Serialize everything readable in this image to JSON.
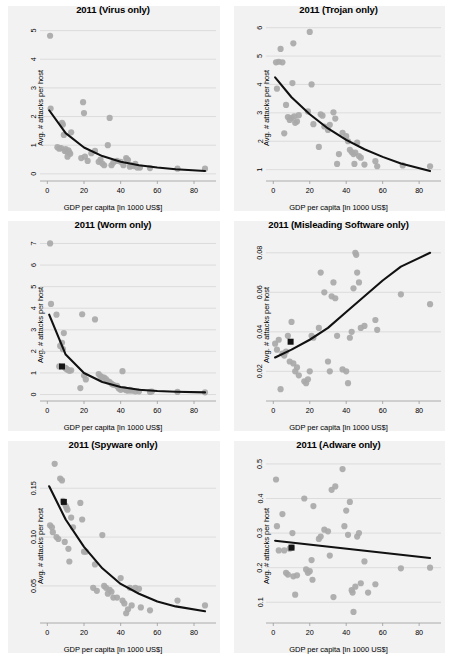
{
  "figure": {
    "name": "avg-attacks-vs-gdp-2011",
    "panel_count": 6,
    "point_color": "#a9a9a9",
    "line_color": "#111111",
    "panel_bg": "#f2f2f2",
    "grid_color": "#d2d2d2"
  },
  "common": {
    "xlabel": "GDP per capita [in 1000 US$]",
    "ylabel": "Avg. # attacks per host",
    "xticks": [
      0,
      20,
      40,
      60,
      80
    ],
    "xlim": [
      -4,
      92
    ],
    "grid": true,
    "legend": "none"
  },
  "chart_data": [
    {
      "type": "scatter",
      "title": "2011 (Virus only)",
      "xlabel": "GDP per capita [in 1000 US$]",
      "ylabel": "Avg. # attacks per host",
      "xlim": [
        -4,
        92
      ],
      "ylim": [
        -0.25,
        5.3
      ],
      "xticks": [
        0,
        20,
        40,
        60,
        80
      ],
      "yticks": [
        0,
        1,
        2,
        3,
        4,
        5
      ],
      "grid": true,
      "x": [
        1.5,
        1.8,
        5.5,
        6.5,
        7.5,
        8.0,
        8.5,
        9.0,
        9.5,
        10.0,
        10.5,
        11.0,
        11.5,
        12.0,
        12.5,
        13.0,
        18.5,
        19.5,
        20.0,
        20.5,
        22.0,
        24.0,
        26.0,
        28.0,
        29.0,
        30.0,
        31.0,
        33.0,
        34.0,
        35.0,
        36.0,
        38.0,
        40.0,
        41.5,
        43.0,
        43.5,
        44.0,
        45.0,
        46.0,
        47.0,
        48.0,
        49.0,
        50.5,
        56.0,
        71.0,
        86.0
      ],
      "y": [
        4.82,
        2.28,
        0.93,
        0.88,
        0.9,
        1.78,
        1.72,
        1.36,
        0.8,
        0.86,
        0.78,
        0.6,
        0.82,
        0.75,
        0.7,
        1.45,
        0.55,
        2.5,
        2.12,
        0.6,
        0.45,
        0.72,
        0.8,
        0.42,
        0.5,
        0.36,
        0.3,
        1.0,
        1.95,
        0.3,
        0.4,
        0.45,
        0.42,
        0.3,
        0.55,
        0.5,
        0.48,
        0.25,
        0.3,
        0.27,
        0.35,
        0.22,
        0.22,
        0.2,
        0.18,
        0.18
      ],
      "fit_type": "exponential-decay",
      "fit_x": [
        1.0,
        10,
        20,
        30,
        40,
        50,
        60,
        70,
        86
      ],
      "fit_y": [
        2.22,
        1.42,
        0.92,
        0.62,
        0.42,
        0.3,
        0.22,
        0.16,
        0.1
      ],
      "highlight_marker": null,
      "annotations": []
    },
    {
      "type": "scatter",
      "title": "2011 (Trojan only)",
      "xlabel": "GDP per capita [in 1000 US$]",
      "ylabel": "Avg. # attacks per host",
      "xlim": [
        -4,
        92
      ],
      "ylim": [
        0.6,
        6.2
      ],
      "xticks": [
        0,
        20,
        40,
        60,
        80
      ],
      "yticks": [
        1,
        2,
        3,
        4,
        5,
        6
      ],
      "grid": true,
      "x": [
        1.5,
        2.0,
        3.0,
        4.0,
        5.0,
        6.0,
        7.0,
        8.0,
        9.0,
        10.0,
        10.5,
        11.0,
        11.5,
        12.0,
        13.0,
        14.0,
        19.0,
        20.0,
        21.0,
        22.0,
        25.0,
        26.0,
        27.0,
        28.0,
        30.0,
        31.0,
        33.0,
        34.0,
        35.0,
        36.0,
        38.0,
        40.0,
        41.0,
        42.0,
        43.0,
        44.0,
        44.5,
        45.0,
        46.0,
        47.0,
        48.0,
        50.0,
        56.0,
        57.0,
        71.0,
        86.0
      ],
      "y": [
        4.78,
        3.85,
        4.8,
        5.25,
        4.78,
        2.28,
        3.28,
        2.85,
        2.75,
        2.82,
        4.05,
        5.45,
        2.88,
        2.65,
        2.7,
        2.92,
        3.05,
        5.85,
        4.0,
        2.6,
        1.8,
        2.95,
        2.9,
        2.52,
        2.4,
        2.58,
        3.02,
        2.8,
        1.2,
        1.55,
        2.3,
        2.18,
        2.0,
        1.7,
        1.62,
        1.55,
        1.2,
        1.6,
        1.95,
        1.48,
        1.42,
        1.18,
        1.3,
        1.12,
        1.15,
        1.12
      ],
      "fit_type": "exponential-decay",
      "fit_x": [
        1.0,
        10,
        20,
        30,
        40,
        50,
        60,
        70,
        86
      ],
      "fit_y": [
        4.25,
        3.55,
        2.95,
        2.45,
        2.05,
        1.72,
        1.45,
        1.22,
        0.95
      ],
      "highlight_marker": null,
      "annotations": []
    },
    {
      "type": "scatter",
      "title": "2011 (Worm only)",
      "xlabel": "GDP per capita [in 1000 US$]",
      "ylabel": "Avg. # attacks per host",
      "xlim": [
        -4,
        92
      ],
      "ylim": [
        -0.3,
        7.3
      ],
      "xticks": [
        0,
        20,
        40,
        60,
        80
      ],
      "yticks": [
        0,
        1,
        2,
        3,
        4,
        5,
        6,
        7
      ],
      "grid": true,
      "x": [
        1.5,
        2.0,
        5.0,
        6.5,
        7.0,
        8.0,
        8.5,
        9.0,
        9.5,
        10.0,
        10.5,
        11.0,
        12.0,
        13.0,
        18.0,
        19.0,
        20.0,
        21.0,
        26.0,
        28.0,
        29.0,
        30.0,
        31.0,
        32.0,
        33.0,
        34.0,
        35.0,
        36.0,
        38.0,
        39.0,
        40.0,
        41.0,
        42.0,
        43.0,
        44.0,
        45.0,
        46.0,
        48.0,
        50.0,
        56.0,
        57.0,
        71.0,
        86.0
      ],
      "y": [
        7.0,
        4.2,
        3.7,
        1.3,
        2.25,
        2.4,
        2.1,
        2.85,
        1.25,
        1.22,
        1.18,
        1.15,
        1.1,
        1.12,
        0.3,
        3.72,
        0.88,
        0.7,
        3.48,
        0.95,
        0.85,
        0.8,
        0.78,
        0.72,
        0.62,
        0.58,
        0.5,
        0.45,
        0.4,
        0.28,
        0.22,
        1.08,
        0.25,
        0.2,
        0.18,
        0.22,
        0.18,
        0.15,
        0.15,
        0.12,
        0.14,
        0.12,
        0.1
      ],
      "fit_type": "exponential-decay",
      "fit_x": [
        1.0,
        10,
        20,
        30,
        40,
        50,
        60,
        70,
        86
      ],
      "fit_y": [
        3.7,
        1.85,
        1.0,
        0.58,
        0.35,
        0.22,
        0.16,
        0.13,
        0.1
      ],
      "highlight_marker": {
        "x": 8.0,
        "y": 1.3
      },
      "annotations": []
    },
    {
      "type": "scatter",
      "title": "2011 (Misleading Software only)",
      "xlabel": "GDP per capita [in 1000 US$]",
      "ylabel": "Avg. # attacks per host",
      "xlim": [
        -4,
        92
      ],
      "ylim": [
        0.005,
        0.088
      ],
      "xticks": [
        0,
        20,
        40,
        60,
        80
      ],
      "yticks": [
        0.02,
        0.04,
        0.06,
        0.08
      ],
      "ytick_labels": [
        "0.02",
        "0.04",
        "0.06",
        "0.08"
      ],
      "grid": true,
      "x": [
        1.0,
        2.0,
        3.0,
        4.0,
        5.0,
        6.0,
        7.0,
        8.0,
        9.0,
        10.0,
        11.0,
        12.0,
        13.0,
        14.0,
        17.0,
        18.0,
        19.0,
        20.0,
        21.0,
        22.0,
        25.0,
        26.0,
        28.0,
        30.0,
        31.0,
        32.0,
        33.0,
        34.0,
        35.0,
        38.0,
        40.0,
        41.0,
        42.0,
        43.0,
        44.0,
        45.0,
        45.5,
        46.0,
        47.0,
        48.0,
        50.0,
        56.0,
        57.0,
        70.0,
        86.0
      ],
      "y": [
        0.034,
        0.031,
        0.036,
        0.011,
        0.029,
        0.028,
        0.03,
        0.038,
        0.025,
        0.045,
        0.024,
        0.02,
        0.022,
        0.018,
        0.015,
        0.014,
        0.016,
        0.02,
        0.038,
        0.037,
        0.042,
        0.07,
        0.06,
        0.025,
        0.02,
        0.058,
        0.065,
        0.057,
        0.038,
        0.021,
        0.02,
        0.014,
        0.037,
        0.04,
        0.062,
        0.08,
        0.079,
        0.07,
        0.065,
        0.042,
        0.043,
        0.046,
        0.041,
        0.059,
        0.054
      ],
      "fit_type": "exponential-growth",
      "fit_x": [
        1.0,
        10,
        20,
        30,
        40,
        50,
        60,
        70,
        86
      ],
      "fit_y": [
        0.027,
        0.031,
        0.036,
        0.042,
        0.05,
        0.058,
        0.066,
        0.073,
        0.08
      ],
      "highlight_marker": {
        "x": 9.5,
        "y": 0.035
      },
      "annotations": []
    },
    {
      "type": "scatter",
      "title": "2011 (Spyware only)",
      "xlabel": "GDP per capita [in 1000 US$]",
      "ylabel": "Avg. # attacks per host",
      "xlim": [
        -4,
        92
      ],
      "ylim": [
        0.012,
        0.182
      ],
      "xticks": [
        0,
        20,
        40,
        60,
        80
      ],
      "yticks": [
        0.05,
        0.1,
        0.15
      ],
      "ytick_labels": [
        "0.05",
        "0.10",
        "0.15"
      ],
      "grid": true,
      "x": [
        1.5,
        2.5,
        3.0,
        4.0,
        5.0,
        6.0,
        7.0,
        8.0,
        8.5,
        9.0,
        9.5,
        10.0,
        10.5,
        11.0,
        11.5,
        12.0,
        13.0,
        14.0,
        18.0,
        19.0,
        20.0,
        21.0,
        25.0,
        26.0,
        27.0,
        30.0,
        31.0,
        32.0,
        33.0,
        34.0,
        35.0,
        36.0,
        38.0,
        40.0,
        41.0,
        42.0,
        43.0,
        44.0,
        45.0,
        46.0,
        48.0,
        50.0,
        51.0,
        56.0,
        71.0,
        86.0
      ],
      "y": [
        0.112,
        0.11,
        0.105,
        0.175,
        0.1,
        0.098,
        0.16,
        0.158,
        0.137,
        0.135,
        0.095,
        0.132,
        0.13,
        0.128,
        0.088,
        0.075,
        0.12,
        0.11,
        0.135,
        0.118,
        0.085,
        0.085,
        0.048,
        0.072,
        0.045,
        0.102,
        0.05,
        0.048,
        0.042,
        0.046,
        0.044,
        0.038,
        0.038,
        0.058,
        0.035,
        0.032,
        0.022,
        0.026,
        0.048,
        0.03,
        0.048,
        0.047,
        0.028,
        0.025,
        0.035,
        0.03
      ],
      "fit_type": "exponential-decay",
      "fit_x": [
        1.0,
        10,
        20,
        30,
        40,
        50,
        60,
        70,
        86
      ],
      "fit_y": [
        0.152,
        0.118,
        0.09,
        0.068,
        0.052,
        0.042,
        0.034,
        0.029,
        0.024
      ],
      "highlight_marker": {
        "x": 9.0,
        "y": 0.136
      },
      "annotations": []
    },
    {
      "type": "scatter",
      "title": "2011 (Adware only)",
      "xlabel": "GDP per capita [in 1000 US$]",
      "ylabel": "Avg. # attacks per host",
      "xlim": [
        -4,
        92
      ],
      "ylim": [
        0.04,
        0.52
      ],
      "xticks": [
        0,
        20,
        40,
        60,
        80
      ],
      "yticks": [
        0.1,
        0.2,
        0.3,
        0.4,
        0.5
      ],
      "ytick_labels": [
        "0.1",
        "0.2",
        "0.3",
        "0.4",
        "0.5"
      ],
      "grid": true,
      "x": [
        1.5,
        2.0,
        3.0,
        5.0,
        6.0,
        7.0,
        8.0,
        9.0,
        10.0,
        10.5,
        11.0,
        12.0,
        13.0,
        17.0,
        18.0,
        19.0,
        20.0,
        21.0,
        21.5,
        22.0,
        25.0,
        26.0,
        28.0,
        30.0,
        31.0,
        32.0,
        33.0,
        34.0,
        38.0,
        39.0,
        40.0,
        41.0,
        42.0,
        43.0,
        43.5,
        44.0,
        45.0,
        46.0,
        47.0,
        48.0,
        50.0,
        52.0,
        56.0,
        70.0,
        86.0
      ],
      "y": [
        0.455,
        0.32,
        0.25,
        0.355,
        0.25,
        0.185,
        0.18,
        0.255,
        0.258,
        0.3,
        0.175,
        0.122,
        0.178,
        0.4,
        0.195,
        0.185,
        0.19,
        0.222,
        0.165,
        0.378,
        0.283,
        0.29,
        0.31,
        0.305,
        0.235,
        0.425,
        0.115,
        0.435,
        0.485,
        0.32,
        0.365,
        0.295,
        0.39,
        0.135,
        0.128,
        0.072,
        0.145,
        0.29,
        0.3,
        0.155,
        0.218,
        0.128,
        0.152,
        0.198,
        0.2
      ],
      "fit_type": "linear",
      "fit_x": [
        1.0,
        86
      ],
      "fit_y": [
        0.278,
        0.228
      ],
      "highlight_marker": {
        "x": 10.0,
        "y": 0.258
      },
      "annotations": []
    }
  ]
}
